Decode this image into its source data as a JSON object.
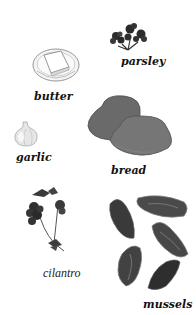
{
  "ingredients": [
    {
      "name": "parsley",
      "label": "parsley",
      "icon": "parsley-icon"
    },
    {
      "name": "butter",
      "label": "butter",
      "icon": "butter-icon"
    },
    {
      "name": "garlic",
      "label": "garlic",
      "icon": "garlic-icon"
    },
    {
      "name": "bread",
      "label": "bread",
      "icon": "bread-icon"
    },
    {
      "name": "cilantro",
      "label": "cilantro",
      "icon": "cilantro-icon"
    },
    {
      "name": "mussels",
      "label": "mussels",
      "icon": "mussels-icon"
    }
  ],
  "colors": {
    "background": "#ffffff",
    "label": "#111111",
    "herb_dark": "#2a2a2a",
    "bread": "#6e6e6e",
    "mussel": "#3c3c3c"
  }
}
